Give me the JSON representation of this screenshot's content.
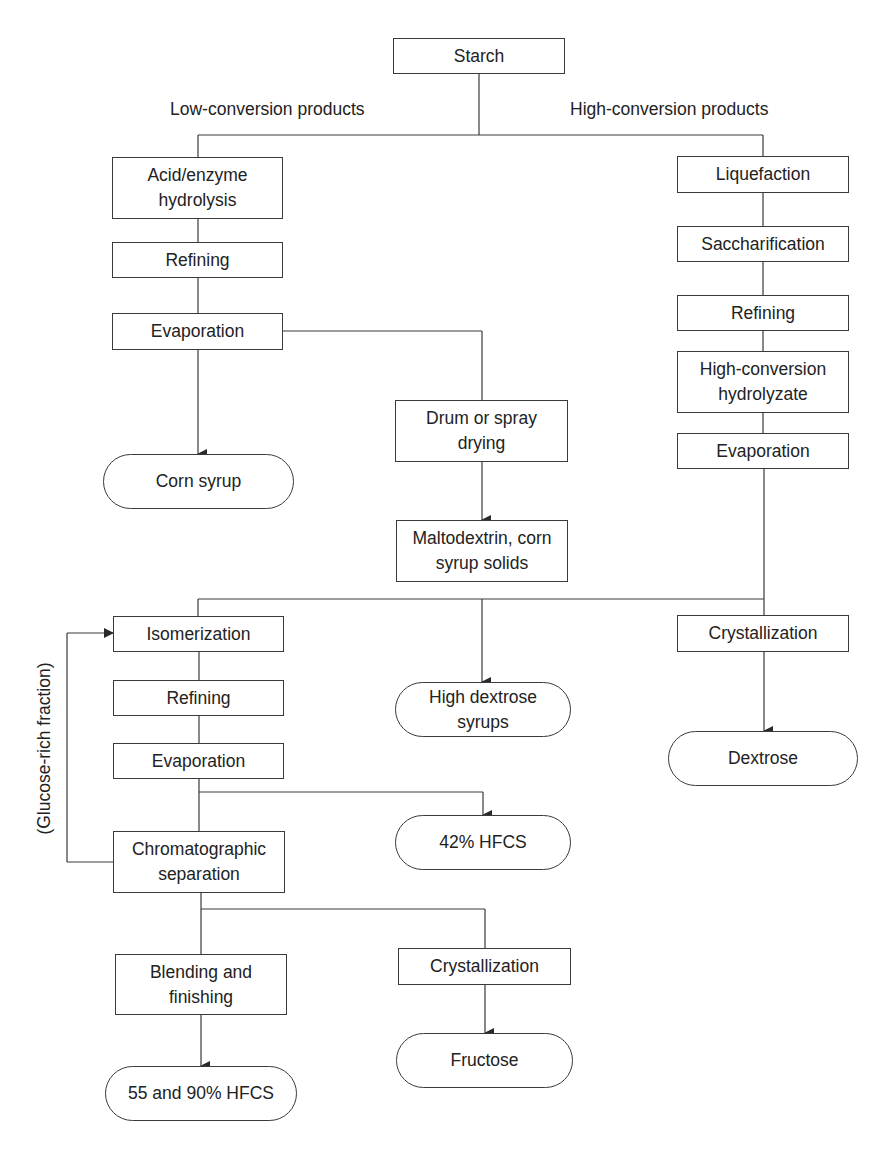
{
  "diagram": {
    "type": "process flowchart",
    "root": {
      "label": "Starch"
    },
    "branch_labels": {
      "low": "Low-conversion products",
      "high": "High-conversion products"
    },
    "low_conversion": {
      "hydrolysis": "Acid/enzyme hydrolysis",
      "refining": "Refining",
      "evaporation": "Evaporation",
      "corn_syrup": "Corn syrup",
      "drying": "Drum or spray drying",
      "maltodextrin": "Maltodextrin, corn syrup solids"
    },
    "high_conversion": {
      "liquefaction": "Liquefaction",
      "saccharification": "Saccharification",
      "refining": "Refining",
      "hydrolyzate": "High-conversion hydrolyzate",
      "evaporation": "Evaporation",
      "crystallization": "Crystallization",
      "dextrose": "Dextrose",
      "high_dextrose_syrups": "High dextrose syrups"
    },
    "hfcs": {
      "isomerization": "Isomerization",
      "refining": "Refining",
      "evaporation": "Evaporation",
      "hfcs42": "42% HFCS",
      "chromatographic": "Chromatographic separation",
      "feedback_label": "(Glucose-rich fraction)",
      "blending": "Blending and finishing",
      "hfcs55_90": "55 and 90% HFCS",
      "crystallization": "Crystallization",
      "fructose": "Fructose"
    },
    "colors": {
      "line": "#3a3a3a",
      "text": "#222222",
      "background": "#ffffff"
    }
  }
}
